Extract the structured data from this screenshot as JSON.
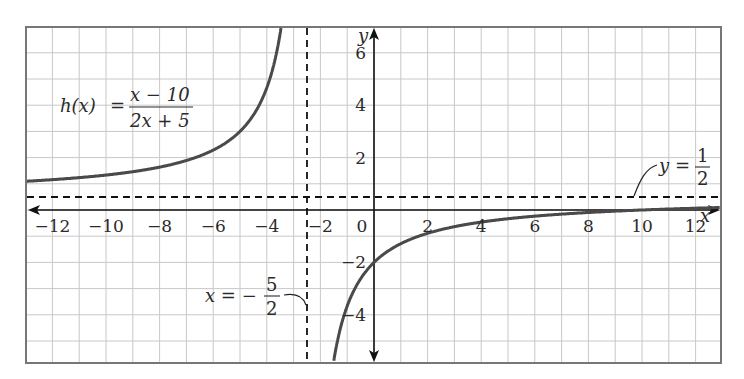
{
  "chart_data": {
    "type": "line",
    "title": "",
    "function_label": {
      "name": "h(x)",
      "equals": "=",
      "numerator": "x − 10",
      "denominator": "2x + 5"
    },
    "xlabel": "x",
    "ylabel": "y",
    "xlim": [
      -12.9,
      13
    ],
    "ylim": [
      -5.8,
      7
    ],
    "grid": true,
    "x_ticks": [
      "−12",
      "−10",
      "−8",
      "−6",
      "−4",
      "−2",
      "0",
      "2",
      "4",
      "6",
      "8",
      "10",
      "12"
    ],
    "y_ticks": [
      "6",
      "4",
      "2",
      "−2",
      "−4"
    ],
    "series": [
      {
        "name": "h(x) = (x − 10)/(2x + 5), left branch",
        "x": [
          -12.9,
          -12,
          -10,
          -8,
          -6,
          -5,
          -4,
          -3.5,
          -3.2,
          -3.0,
          -2.9
        ],
        "values": [
          1.12,
          1.16,
          1.33,
          1.64,
          2.29,
          3.0,
          4.67,
          6.75,
          9.43,
          13.0,
          16.2
        ]
      },
      {
        "name": "h(x) = (x − 10)/(2x + 5), right branch",
        "x": [
          -2.0,
          -1.5,
          -1,
          0,
          2,
          4,
          6,
          8,
          10,
          12,
          13
        ],
        "values": [
          -12.0,
          -5.75,
          -3.67,
          -2.0,
          -0.89,
          -0.46,
          -0.24,
          -0.1,
          0.0,
          0.07,
          0.1
        ]
      }
    ],
    "asymptotes": {
      "vertical": {
        "x": -2.5,
        "label_lhs": "x = −",
        "label_num": "5",
        "label_den": "2"
      },
      "horizontal": {
        "y": 0.5,
        "label_lhs": "y =",
        "label_num": "1",
        "label_den": "2"
      }
    },
    "colors": {
      "curve": "#4a4a4a",
      "grid": "#c8c8c8",
      "axis": "#111111",
      "border": "#777777"
    }
  }
}
